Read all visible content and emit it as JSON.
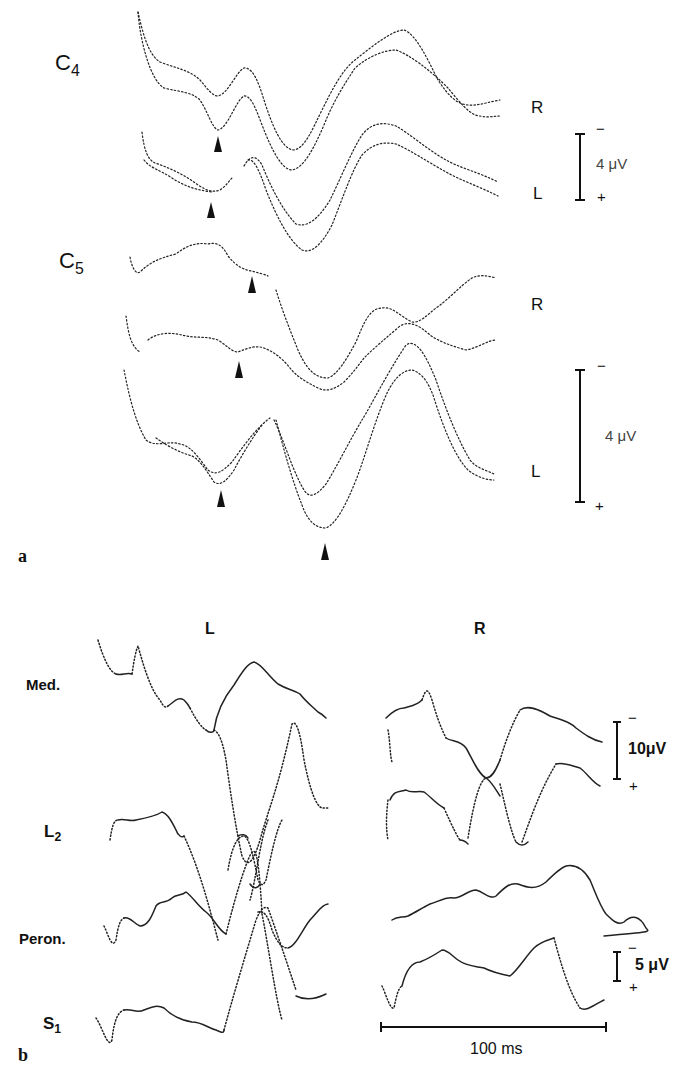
{
  "figure": {
    "panels": [
      {
        "id": "a",
        "letter": "a",
        "trace_groups": [
          {
            "label_main": "C",
            "label_sub": "4",
            "rows": [
              "R",
              "L"
            ]
          },
          {
            "label_main": "C",
            "label_sub": "5",
            "rows": [
              "R",
              "L"
            ]
          }
        ],
        "scale_bars": [
          {
            "minus": "−",
            "plus": "+",
            "value": "4 μV"
          },
          {
            "minus": "−",
            "plus": "+",
            "value": "4 μV"
          }
        ],
        "markers": "black arrowheads indicating peak latencies"
      },
      {
        "id": "b",
        "letter": "b",
        "columns": [
          "L",
          "R"
        ],
        "trace_labels": [
          {
            "main": "Med.",
            "sub": ""
          },
          {
            "main": "L",
            "sub": "2"
          },
          {
            "main": "Peron.",
            "sub": ""
          },
          {
            "main": "S",
            "sub": "1"
          }
        ],
        "scale_bars": [
          {
            "minus": "−",
            "plus": "+",
            "value": "10μV"
          },
          {
            "minus": "−",
            "plus": "+",
            "value": "5 μV"
          }
        ],
        "time_bar": {
          "value": "100 ms"
        }
      }
    ]
  },
  "labels": {
    "a_letter": "a",
    "b_letter": "b",
    "c4_main": "C",
    "c4_sub": "4",
    "c5_main": "C",
    "c5_sub": "5",
    "a_R1": "R",
    "a_L1": "L",
    "a_R2": "R",
    "a_L2": "L",
    "a_scale1": "4 μV",
    "a_scale2": "4 μV",
    "minus": "−",
    "plus": "+",
    "b_col_L": "L",
    "b_col_R": "R",
    "med": "Med.",
    "l2_main": "L",
    "l2_sub": "2",
    "peron": "Peron.",
    "s1_main": "S",
    "s1_sub": "1",
    "b_scale1": "10μV",
    "b_scale2": "5 μV",
    "time": "100 ms"
  }
}
